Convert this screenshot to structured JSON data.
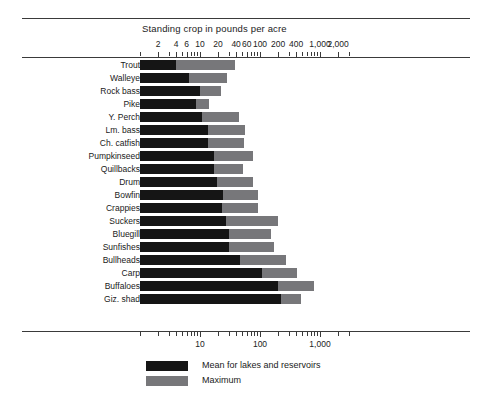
{
  "chart_data": {
    "type": "bar",
    "title": "Standing crop in pounds per acre",
    "xlabel": "Standing crop in pounds per acre",
    "ylabel": "",
    "scale": "log",
    "xlim": [
      1,
      3000
    ],
    "grid": false,
    "legend_position": "bottom-left",
    "orientation": "horizontal",
    "top_tick_labels": [
      "2",
      "4",
      "6",
      "10",
      "20",
      "40",
      "60",
      "100",
      "200",
      "400",
      "1,000",
      "2,000"
    ],
    "top_tick_values": [
      2,
      4,
      6,
      10,
      20,
      40,
      60,
      100,
      200,
      400,
      1000,
      2000
    ],
    "bottom_tick_labels": [
      "10",
      "100",
      "1,000"
    ],
    "bottom_tick_values": [
      10,
      100,
      1000
    ],
    "categories": [
      "Trout",
      "Walleye",
      "Rock bass",
      "Pike",
      "Y. Perch",
      "Lm. bass",
      "Ch. catfish",
      "Pumpkinseed",
      "Quillbacks",
      "Drum",
      "Bowfin",
      "Crappies",
      "Suckers",
      "Bluegill",
      "Sunfishes",
      "Bullheads",
      "Carp",
      "Buffaloes",
      "Giz. shad"
    ],
    "series": [
      {
        "name": "Mean for lakes and reservoirs",
        "color": "#151515",
        "values": [
          4.0,
          6.5,
          10.0,
          8.5,
          11.0,
          13.5,
          13.5,
          17.0,
          17.0,
          19.5,
          24.0,
          23.0,
          27.0,
          30.0,
          31.0,
          47.0,
          110.0,
          200.0,
          220.0
        ]
      },
      {
        "name": "Maximum",
        "color": "#77777a",
        "values": [
          38.0,
          28.0,
          22.0,
          14.0,
          45.0,
          57.0,
          55.0,
          75.0,
          52.0,
          75.0,
          92.0,
          92.0,
          200.0,
          150.0,
          170.0,
          270.0,
          420.0,
          800.0,
          480.0
        ]
      }
    ],
    "legend": [
      {
        "label": "Mean for lakes and reservoirs",
        "color": "#151515"
      },
      {
        "label": "Maximum",
        "color": "#77777a"
      }
    ]
  }
}
